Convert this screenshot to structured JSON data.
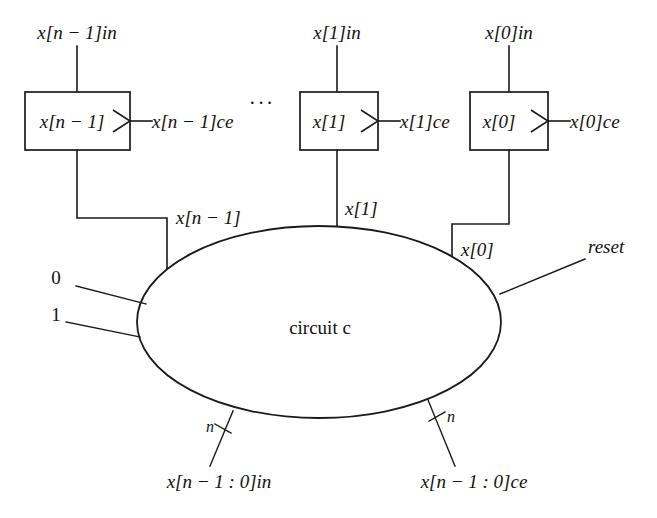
{
  "diagram": {
    "line_color": "#1a1a1a",
    "background": "#ffffff",
    "center_label": "circuit c",
    "ellipsis": "···"
  },
  "registers": [
    {
      "id": "reg-n-1",
      "box_label": "x[n − 1]",
      "top_input_label": "x[n − 1]in",
      "ce_label": "x[n − 1]ce",
      "output_label": "x[n − 1]"
    },
    {
      "id": "reg-1",
      "box_label": "x[1]",
      "top_input_label": "x[1]in",
      "ce_label": "x[1]ce",
      "output_label": "x[1]"
    },
    {
      "id": "reg-0",
      "box_label": "x[0]",
      "top_input_label": "x[0]in",
      "ce_label": "x[0]ce",
      "output_label": "x[0]"
    }
  ],
  "constant_inputs": [
    {
      "id": "const-zero",
      "label": "0"
    },
    {
      "id": "const-one",
      "label": "1"
    }
  ],
  "signals": {
    "reset": "reset",
    "bus_in": "x[n − 1 : 0]in",
    "bus_ce": "x[n − 1 : 0]ce",
    "bus_width_left": "n",
    "bus_width_right": "n"
  }
}
